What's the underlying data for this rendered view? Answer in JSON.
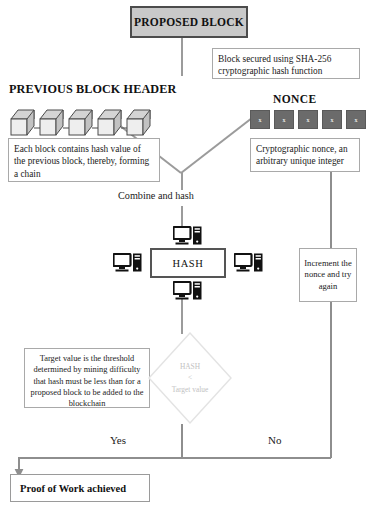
{
  "diagram": {
    "proposed_block": {
      "label": "PROPOSED BLOCK"
    },
    "sha_note": {
      "text": "Block secured using SHA-256 cryptographic hash function"
    },
    "previous_block_header": {
      "heading": "PREVIOUS BLOCK HEADER",
      "note": "Each block contains hash value of the previous block, thereby, forming a chain",
      "cube_count": 5
    },
    "nonce": {
      "heading": "NONCE",
      "cells": [
        "x",
        "x",
        "x",
        "x",
        "x"
      ],
      "note": "Cryptographic nonce, an arbitrary unique integer"
    },
    "combine_label": "Combine and hash",
    "hash_box": {
      "label": "HASH"
    },
    "miners": {
      "icon": "computer-icon",
      "count": 4
    },
    "increment_note": "Increment the nonce and try again",
    "decision": {
      "line1": "HASH",
      "line2": "<",
      "line3": "Target value"
    },
    "target_note": "Target value is the threshold determined by mining difficulty that hash must be less than for a proposed block to be added to the blockchain",
    "branch_yes": "Yes",
    "branch_no": "No",
    "result": {
      "label": "Proof of Work achieved"
    }
  },
  "colors": {
    "proposed_block_fill": "#c9c9c9",
    "proposed_block_border": "#4c4c4c",
    "nonce_cell_fill": "#6b6b6b",
    "connector": "#9b9b9b",
    "diamond_stroke": "#e0e0e0",
    "diamond_text": "#c2c2c2",
    "box_border": "#a9a9a9",
    "text": "#111111"
  }
}
